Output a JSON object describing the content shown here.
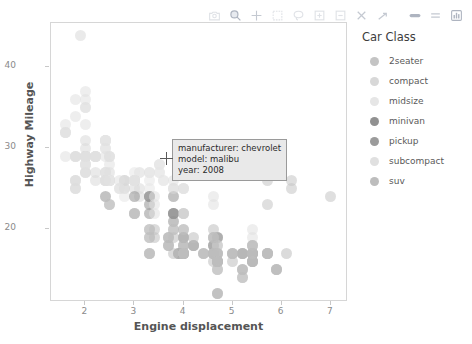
{
  "modebar": {
    "buttons": [
      {
        "name": "camera-icon",
        "label": "Download plot as png"
      },
      {
        "name": "zoom-icon",
        "label": "Zoom"
      },
      {
        "name": "pan-icon",
        "label": "Pan"
      },
      {
        "name": "box-select-icon",
        "label": "Box Select"
      },
      {
        "name": "lasso-select-icon",
        "label": "Lasso Select"
      },
      {
        "name": "zoom-in-icon",
        "label": "Zoom in"
      },
      {
        "name": "zoom-out-icon",
        "label": "Zoom out"
      },
      {
        "name": "autoscale-icon",
        "label": "Autoscale"
      },
      {
        "name": "reset-axes-icon",
        "label": "Reset axes"
      },
      {
        "name": "toggle-spike-lines-icon",
        "label": "Toggle Spike Lines"
      },
      {
        "name": "hover-compare-icon",
        "label": "Show closest data on hover"
      },
      {
        "name": "plotly-logo-icon",
        "label": "Produced with Plotly"
      }
    ]
  },
  "tooltip": {
    "manufacturer": "manufacturer: chevrolet",
    "model": "model: malibu",
    "year": "year: 2008"
  },
  "legend": {
    "title": "Car Class",
    "items": [
      {
        "label": "2seater",
        "color": "#c4c4c4"
      },
      {
        "label": "compact",
        "color": "#d8d8d8"
      },
      {
        "label": "midsize",
        "color": "#e6e6e6"
      },
      {
        "label": "minivan",
        "color": "#919191"
      },
      {
        "label": "pickup",
        "color": "#9b9b9b"
      },
      {
        "label": "subcompact",
        "color": "#e0e0e0"
      },
      {
        "label": "suv",
        "color": "#bdbdbd"
      }
    ]
  },
  "chart_data": {
    "type": "scatter",
    "title": "",
    "xlabel": "Engine displacement",
    "ylabel": "Highway Mileage",
    "xlim": [
      1.3,
      7.35
    ],
    "ylim": [
      11.0,
      45.5
    ],
    "xticks": [
      2,
      3,
      4,
      5,
      6,
      7
    ],
    "yticks": [
      20,
      30,
      40
    ],
    "grid": false,
    "legend_position": "right",
    "legend_title": "Car Class",
    "color_by": "class",
    "marker_opacity": 0.55,
    "marker_size": 11,
    "series": [
      {
        "name": "2seater",
        "color": "#c4c4c4",
        "points": [
          [
            5.7,
            26
          ],
          [
            5.7,
            23
          ],
          [
            6.2,
            26
          ],
          [
            6.2,
            25
          ],
          [
            7.0,
            24
          ]
        ]
      },
      {
        "name": "compact",
        "color": "#d8d8d8",
        "points": [
          [
            1.8,
            29
          ],
          [
            1.8,
            29
          ],
          [
            2.0,
            31
          ],
          [
            2.0,
            30
          ],
          [
            2.8,
            26
          ],
          [
            2.8,
            26
          ],
          [
            3.1,
            27
          ],
          [
            1.8,
            26
          ],
          [
            1.8,
            25
          ],
          [
            2.0,
            28
          ],
          [
            2.0,
            27
          ],
          [
            2.8,
            25
          ],
          [
            2.8,
            25
          ],
          [
            3.1,
            25
          ],
          [
            3.1,
            24
          ],
          [
            2.4,
            27
          ],
          [
            2.4,
            26
          ],
          [
            2.5,
            26
          ],
          [
            2.5,
            26
          ],
          [
            3.3,
            24
          ],
          [
            2.0,
            29
          ],
          [
            2.0,
            29
          ],
          [
            2.8,
            26
          ],
          [
            1.9,
            44
          ],
          [
            2.0,
            29
          ],
          [
            2.0,
            29
          ],
          [
            2.5,
            27
          ],
          [
            2.5,
            26
          ],
          [
            2.2,
            27
          ],
          [
            2.2,
            26
          ],
          [
            2.4,
            27
          ],
          [
            2.4,
            26
          ],
          [
            3.0,
            26
          ],
          [
            3.0,
            25
          ],
          [
            3.5,
            28
          ],
          [
            2.2,
            29
          ],
          [
            2.2,
            29
          ],
          [
            2.4,
            31
          ],
          [
            2.4,
            31
          ],
          [
            3.0,
            26
          ],
          [
            3.0,
            26
          ],
          [
            3.3,
            27
          ],
          [
            1.8,
            26
          ],
          [
            1.8,
            25
          ],
          [
            2.0,
            28
          ],
          [
            2.0,
            27
          ]
        ]
      },
      {
        "name": "midsize",
        "color": "#e6e6e6",
        "points": [
          [
            2.4,
            31
          ],
          [
            3.0,
            26
          ],
          [
            3.0,
            26
          ],
          [
            3.5,
            27
          ],
          [
            2.2,
            29
          ],
          [
            2.2,
            29
          ],
          [
            2.4,
            31
          ],
          [
            2.4,
            31
          ],
          [
            3.0,
            26
          ],
          [
            3.0,
            26
          ],
          [
            3.3,
            27
          ],
          [
            2.5,
            26
          ],
          [
            2.5,
            26
          ],
          [
            3.3,
            24
          ],
          [
            3.5,
            27
          ],
          [
            3.6,
            26
          ],
          [
            2.4,
            30
          ],
          [
            3.0,
            26
          ],
          [
            3.3,
            25
          ],
          [
            3.8,
            25
          ],
          [
            3.8,
            25
          ],
          [
            4.0,
            25
          ],
          [
            2.0,
            28
          ],
          [
            2.0,
            29
          ],
          [
            2.4,
            27
          ],
          [
            2.4,
            26
          ],
          [
            2.5,
            26
          ],
          [
            2.5,
            26
          ],
          [
            3.5,
            28
          ],
          [
            3.0,
            27
          ],
          [
            3.3,
            26
          ],
          [
            2.8,
            24
          ],
          [
            3.6,
            26
          ]
        ]
      },
      {
        "name": "minivan",
        "color": "#919191",
        "points": [
          [
            2.4,
            24
          ],
          [
            3.0,
            24
          ],
          [
            3.3,
            22
          ],
          [
            3.3,
            24
          ],
          [
            3.8,
            22
          ],
          [
            3.8,
            22
          ],
          [
            3.8,
            24
          ],
          [
            4.0,
            22
          ],
          [
            3.3,
            23
          ],
          [
            3.8,
            21
          ],
          [
            3.8,
            22
          ],
          [
            3.3,
            24
          ]
        ]
      },
      {
        "name": "pickup",
        "color": "#9b9b9b",
        "points": [
          [
            3.7,
            19
          ],
          [
            3.7,
            18
          ],
          [
            4.0,
            17
          ],
          [
            4.0,
            19
          ],
          [
            4.7,
            19
          ],
          [
            4.7,
            19
          ],
          [
            4.7,
            12
          ],
          [
            5.2,
            17
          ],
          [
            5.2,
            15
          ],
          [
            3.9,
            17
          ],
          [
            3.9,
            17
          ],
          [
            4.7,
            16
          ],
          [
            4.7,
            16
          ],
          [
            4.7,
            17
          ],
          [
            5.2,
            17
          ],
          [
            5.7,
            17
          ],
          [
            5.9,
            15
          ],
          [
            4.2,
            18
          ],
          [
            4.6,
            17
          ],
          [
            4.6,
            18
          ],
          [
            5.4,
            17
          ],
          [
            5.4,
            17
          ],
          [
            5.4,
            16
          ],
          [
            4.0,
            18
          ],
          [
            4.0,
            19
          ],
          [
            4.6,
            18
          ],
          [
            5.0,
            17
          ],
          [
            4.2,
            18
          ],
          [
            4.4,
            17
          ],
          [
            4.6,
            17
          ],
          [
            5.4,
            17
          ],
          [
            5.4,
            16
          ],
          [
            4.0,
            17
          ]
        ]
      },
      {
        "name": "subcompact",
        "color": "#e0e0e0",
        "points": [
          [
            2.0,
            33
          ],
          [
            2.0,
            35
          ],
          [
            2.0,
            37
          ],
          [
            2.0,
            35
          ],
          [
            2.5,
            29
          ],
          [
            2.5,
            29
          ],
          [
            2.2,
            29
          ],
          [
            2.2,
            29
          ],
          [
            3.8,
            26
          ],
          [
            3.8,
            25
          ],
          [
            4.0,
            25
          ],
          [
            4.0,
            25
          ],
          [
            4.6,
            23
          ],
          [
            4.6,
            24
          ],
          [
            5.4,
            20
          ],
          [
            5.4,
            19
          ],
          [
            1.6,
            33
          ],
          [
            1.6,
            32
          ],
          [
            1.6,
            32
          ],
          [
            1.6,
            29
          ],
          [
            1.6,
            32
          ],
          [
            1.8,
            34
          ],
          [
            1.8,
            36
          ],
          [
            2.0,
            36
          ],
          [
            2.4,
            29
          ],
          [
            2.4,
            30
          ],
          [
            2.5,
            28
          ],
          [
            2.5,
            29
          ],
          [
            1.8,
            29
          ],
          [
            1.8,
            26
          ],
          [
            2.0,
            29
          ],
          [
            2.0,
            29
          ],
          [
            2.4,
            26
          ],
          [
            2.4,
            26
          ],
          [
            2.7,
            25
          ],
          [
            2.7,
            25
          ],
          [
            3.4,
            24
          ],
          [
            3.4,
            22
          ],
          [
            4.0,
            22
          ],
          [
            4.7,
            18
          ],
          [
            5.7,
            17
          ],
          [
            2.7,
            26
          ],
          [
            3.0,
            26
          ],
          [
            3.4,
            23
          ]
        ]
      },
      {
        "name": "suv",
        "color": "#bdbdbd",
        "points": [
          [
            4.0,
            17
          ],
          [
            4.0,
            17
          ],
          [
            4.0,
            17
          ],
          [
            4.6,
            17
          ],
          [
            4.6,
            17
          ],
          [
            4.6,
            17
          ],
          [
            5.0,
            17
          ],
          [
            5.0,
            16
          ],
          [
            5.7,
            17
          ],
          [
            5.9,
            15
          ],
          [
            3.3,
            17
          ],
          [
            3.3,
            17
          ],
          [
            4.0,
            17
          ],
          [
            4.7,
            16
          ],
          [
            4.7,
            15
          ],
          [
            5.2,
            14
          ],
          [
            5.7,
            17
          ],
          [
            5.9,
            15
          ],
          [
            4.2,
            18
          ],
          [
            4.6,
            17
          ],
          [
            4.6,
            17
          ],
          [
            5.4,
            17
          ],
          [
            5.4,
            16
          ],
          [
            3.8,
            17
          ],
          [
            4.0,
            17
          ],
          [
            4.0,
            17
          ],
          [
            4.0,
            17
          ],
          [
            4.6,
            16
          ],
          [
            5.4,
            17
          ],
          [
            5.4,
            17
          ],
          [
            4.0,
            20
          ],
          [
            4.2,
            19
          ],
          [
            4.4,
            17
          ],
          [
            4.6,
            19
          ],
          [
            5.4,
            18
          ],
          [
            2.5,
            23
          ],
          [
            2.5,
            23
          ],
          [
            3.0,
            22
          ],
          [
            3.0,
            22
          ],
          [
            3.4,
            20
          ],
          [
            3.4,
            19
          ],
          [
            4.0,
            18
          ],
          [
            4.7,
            17
          ],
          [
            4.7,
            17
          ],
          [
            4.7,
            16
          ],
          [
            5.7,
            17
          ],
          [
            6.1,
            17
          ],
          [
            4.0,
            20
          ],
          [
            4.7,
            18
          ],
          [
            5.0,
            17
          ],
          [
            5.7,
            17
          ],
          [
            5.4,
            16
          ],
          [
            3.7,
            19
          ],
          [
            3.7,
            18
          ],
          [
            4.0,
            17
          ],
          [
            5.2,
            14
          ],
          [
            4.7,
            16
          ],
          [
            4.7,
            16
          ],
          [
            5.2,
            17
          ],
          [
            5.2,
            15
          ],
          [
            3.0,
            22
          ],
          [
            3.3,
            20
          ],
          [
            3.3,
            20
          ],
          [
            3.3,
            19
          ],
          [
            3.3,
            17
          ],
          [
            3.3,
            19
          ],
          [
            3.8,
            20
          ],
          [
            3.8,
            20
          ],
          [
            3.8,
            19
          ],
          [
            4.0,
            19
          ],
          [
            4.6,
            19
          ],
          [
            4.6,
            19
          ],
          [
            4.6,
            20
          ],
          [
            5.4,
            18
          ],
          [
            5.4,
            18
          ],
          [
            4.7,
            12
          ],
          [
            4.7,
            15
          ]
        ]
      }
    ]
  }
}
